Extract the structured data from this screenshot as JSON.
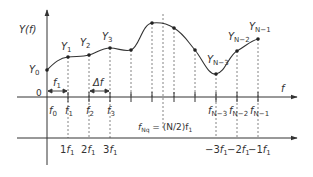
{
  "diagram": {
    "colors": {
      "line": "#333333",
      "dash": "#555555",
      "background": "#ffffff"
    },
    "y_axis_label": "Y(f)",
    "upper_axis_label": "f",
    "origin_label": "0",
    "interval_labels": {
      "f1_span": "f1",
      "delta_f": "Δf"
    },
    "sample_labels": [
      {
        "base": "Y",
        "sub": "0"
      },
      {
        "base": "Y",
        "sub": "1"
      },
      {
        "base": "Y",
        "sub": "2"
      },
      {
        "base": "Y",
        "sub": "3"
      },
      {
        "base": "Y",
        "sub": "N−3"
      },
      {
        "base": "Y",
        "sub": "N−2"
      },
      {
        "base": "Y",
        "sub": "N−1"
      }
    ],
    "upper_tick_labels": [
      {
        "base": "f",
        "sub": "0"
      },
      {
        "base": "f",
        "sub": "1"
      },
      {
        "base": "f",
        "sub": "2"
      },
      {
        "base": "f",
        "sub": "3"
      },
      {
        "base": "f",
        "sub": "N−3"
      },
      {
        "base": "f",
        "sub": "N−2"
      },
      {
        "base": "f",
        "sub": "N−1"
      }
    ],
    "nyquist_label": {
      "base": "f",
      "sub": "Nq",
      "rest": " = (N/2)f",
      "rest_sub": "1"
    },
    "lower_tick_labels": [
      {
        "coef": "1",
        "base": "f",
        "sub": "1"
      },
      {
        "coef": "2",
        "base": "f",
        "sub": "1"
      },
      {
        "coef": "3",
        "base": "f",
        "sub": "1"
      },
      {
        "coef": "−3",
        "base": "f",
        "sub": "1"
      },
      {
        "coef": "−2",
        "base": "f",
        "sub": "1"
      },
      {
        "coef": "−1",
        "base": "f",
        "sub": "1"
      }
    ],
    "sample_points": [
      {
        "x": 47,
        "y": 70
      },
      {
        "x": 68,
        "y": 57
      },
      {
        "x": 89,
        "y": 55
      },
      {
        "x": 110,
        "y": 48
      },
      {
        "x": 131,
        "y": 50
      },
      {
        "x": 152,
        "y": 23
      },
      {
        "x": 174,
        "y": 28
      },
      {
        "x": 195,
        "y": 50
      },
      {
        "x": 216,
        "y": 74
      },
      {
        "x": 237,
        "y": 51
      },
      {
        "x": 258,
        "y": 39
      }
    ]
  }
}
